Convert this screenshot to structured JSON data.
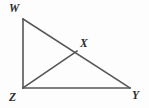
{
  "figure": {
    "kind": "geometry-diagram",
    "canvas": {
      "width": 149,
      "height": 108,
      "background": "#fdfdfd"
    },
    "style": {
      "stroke_color": "#565656",
      "stroke_width": 1.6,
      "label_color": "#2b2b2b",
      "label_font_size": 11.5
    },
    "points": [
      {
        "id": "W",
        "label": "W",
        "x": 23,
        "y": 19,
        "label_x": 14,
        "label_y": 8
      },
      {
        "id": "X",
        "label": "X",
        "x": 77,
        "y": 51,
        "label_x": 85,
        "label_y": 43
      },
      {
        "id": "Y",
        "label": "Y",
        "x": 130,
        "y": 88,
        "label_x": 137,
        "label_y": 95
      },
      {
        "id": "Z",
        "label": "Z",
        "x": 23,
        "y": 88,
        "label_x": 14,
        "label_y": 97
      }
    ],
    "segments": [
      {
        "id": "WZ",
        "from": "W",
        "to": "Z",
        "x1": 23,
        "y1": 19,
        "x2": 23,
        "y2": 88
      },
      {
        "id": "ZY",
        "from": "Z",
        "to": "Y",
        "x1": 23,
        "y1": 88,
        "x2": 130,
        "y2": 88
      },
      {
        "id": "WY",
        "from": "W",
        "to": "Y",
        "x1": 23,
        "y1": 19,
        "x2": 130,
        "y2": 88
      },
      {
        "id": "ZX",
        "from": "Z",
        "to": "X",
        "x1": 23,
        "y1": 88,
        "x2": 77,
        "y2": 51
      }
    ],
    "labels": {
      "W": "W",
      "X": "X",
      "Y": "Y",
      "Z": "Z"
    }
  }
}
